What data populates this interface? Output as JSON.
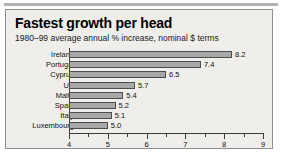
{
  "panel": {
    "title": "Fastest growth per head",
    "subtitle": "1980–99 average annual % increase, nominal $ terms"
  },
  "chart_data": {
    "type": "bar",
    "orientation": "horizontal",
    "title": "Fastest growth per head",
    "subtitle": "1980–99 average annual % increase, nominal $ terms",
    "xlabel": "",
    "ylabel": "",
    "xlim": [
      4,
      9
    ],
    "xticks": [
      4,
      5,
      6,
      7,
      8,
      9
    ],
    "xtick_labels": [
      "4",
      "5",
      "6",
      "7",
      "8",
      "9"
    ],
    "minor_tick_step": 0.5,
    "grid": false,
    "legend": false,
    "bar_color": "#a8a8a8",
    "bar_edge_color": "#4d4d4d",
    "categories": [
      "Ireland",
      "Portugal",
      "Cyprus",
      "UK",
      "Malta",
      "Spain",
      "Italy",
      "Luxembourg"
    ],
    "values": [
      8.2,
      7.4,
      6.5,
      5.7,
      5.4,
      5.2,
      5.1,
      5.0
    ],
    "value_labels": [
      "8.2",
      "7.4",
      "6.5",
      "5.7",
      "5.4",
      "5.2",
      "5.1",
      "5.0"
    ]
  }
}
